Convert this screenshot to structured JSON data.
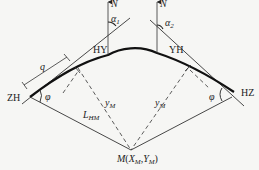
{
  "diagram": {
    "title": "",
    "colors": {
      "ink": "#222222",
      "background": "#f6f6f4"
    },
    "points": {
      "start": "ZH",
      "end": "HZ",
      "circle_start": "HY",
      "circle_end": "YH",
      "target": {
        "name": "M",
        "open": "(",
        "x": "X",
        "x_sub": "M",
        "sep": ",",
        "y": "Y",
        "y_sub": "M",
        "close": ")"
      }
    },
    "labels": {
      "north_left": "N",
      "north_right": "N",
      "alpha1": "α",
      "alpha1_sub": "1",
      "alpha2": "α",
      "alpha2_sub": "2",
      "q": "q",
      "phi_left": "φ",
      "phi_right": "φ",
      "l_hm": "L",
      "l_hm_sub": "HM",
      "y_m_left": "y",
      "y_m_left_sub": "M",
      "y_m_right": "y",
      "y_m_right_sub": "M"
    }
  }
}
